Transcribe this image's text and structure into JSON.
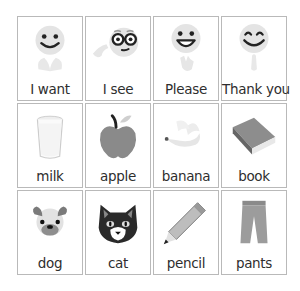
{
  "board": {
    "cards": [
      {
        "label": "I want",
        "icon": "smiling-face-hands-icon"
      },
      {
        "label": "I see",
        "icon": "glasses-face-pointing-icon"
      },
      {
        "label": "Please",
        "icon": "grinning-face-waving-hand-icon"
      },
      {
        "label": "Thank you",
        "icon": "happy-face-praying-hands-icon"
      },
      {
        "label": "milk",
        "icon": "glass-of-milk-icon"
      },
      {
        "label": "apple",
        "icon": "apple-icon"
      },
      {
        "label": "banana",
        "icon": "banana-icon"
      },
      {
        "label": "book",
        "icon": "book-icon"
      },
      {
        "label": "dog",
        "icon": "dog-face-icon"
      },
      {
        "label": "cat",
        "icon": "cat-face-icon"
      },
      {
        "label": "pencil",
        "icon": "pencil-icon"
      },
      {
        "label": "pants",
        "icon": "pants-icon"
      }
    ]
  },
  "colors": {
    "border": "#b9b9b9",
    "face": "#e6e6e6",
    "dark": "#222222",
    "gray": "#9a9a9a",
    "label": "#2e2e2e"
  }
}
